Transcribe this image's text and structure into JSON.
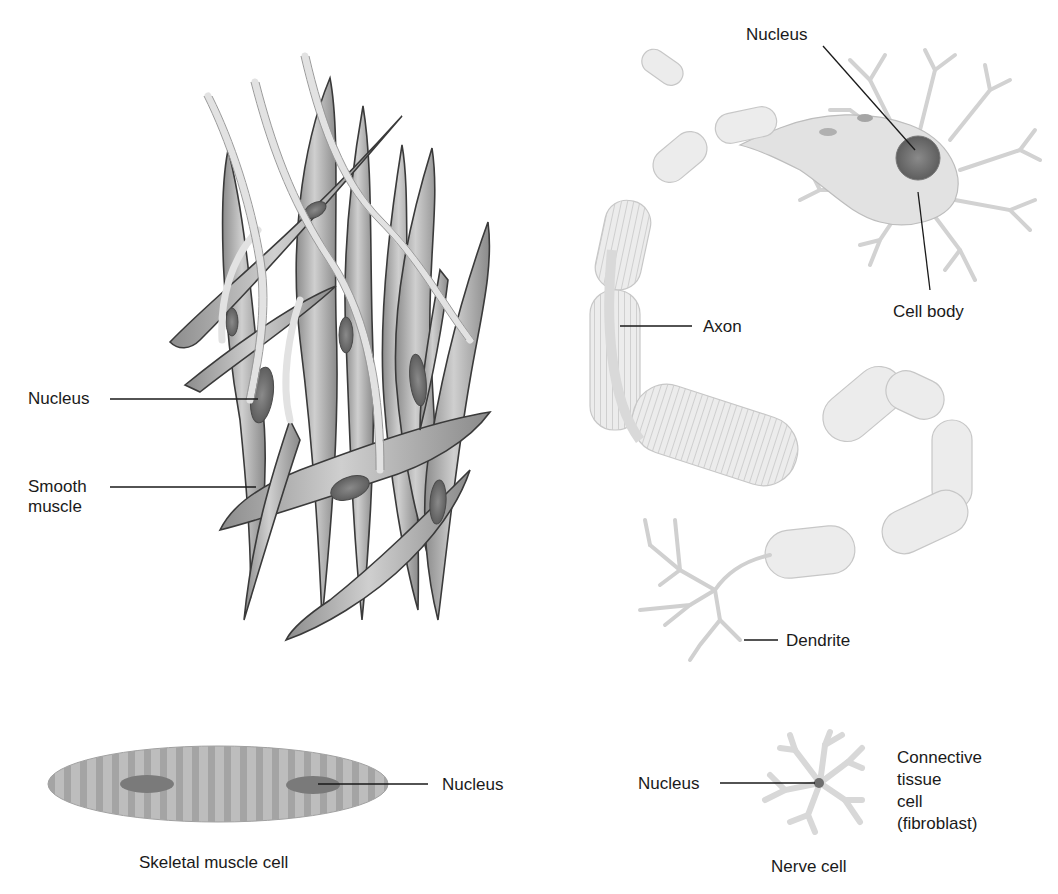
{
  "figure": {
    "panels": [
      {
        "id": "smooth-muscle",
        "labels": {
          "nucleus": "Nucleus",
          "cell_type": "Smooth\nmuscle"
        }
      },
      {
        "id": "nerve-cell-detail",
        "labels": {
          "nucleus": "Nucleus",
          "cell_body": "Cell body",
          "axon": "Axon",
          "dendrite": "Dendrite"
        }
      },
      {
        "id": "skeletal-muscle",
        "labels": {
          "nucleus": "Nucleus",
          "caption": "Skeletal muscle cell"
        }
      },
      {
        "id": "connective-tissue",
        "labels": {
          "nucleus": "Nucleus",
          "cell_type": "Connective\ntissue\ncell\n(fibroblast)",
          "caption": "Nerve cell"
        }
      }
    ],
    "colors": {
      "smooth_muscle_fill": "#a8a8a8",
      "smooth_muscle_outline": "#3a3a3a",
      "nucleus_fill": "#6a6a6a",
      "nerve_fill": "#e6e6e6",
      "skeletal_fill": "#b5b5b5",
      "fibroblast_fill": "#d9d9d9",
      "label_text": "#1a1a1a"
    }
  }
}
